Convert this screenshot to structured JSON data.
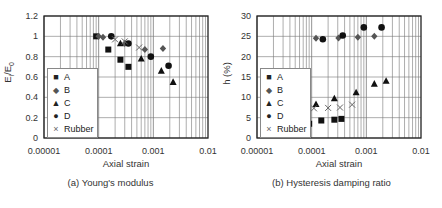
{
  "chart_data": [
    {
      "type": "scatter",
      "title": "",
      "caption": "(a) Young's modulus",
      "xlabel": "Axial strain",
      "ylabel": "Ei/E0",
      "xscale": "log",
      "xlim": [
        1e-05,
        0.01
      ],
      "ylim": [
        0,
        1.2
      ],
      "xticks": [
        "0.00001",
        "0.0001",
        "0.001",
        "0.01"
      ],
      "yticks": [
        "0",
        "0.2",
        "0.4",
        "0.6",
        "0.8",
        "1",
        "1.2"
      ],
      "grid": true,
      "legend_position": "lower left",
      "series": [
        {
          "name": "A",
          "marker": "square",
          "x": [
            9e-05,
            0.00015,
            0.00025,
            0.00035
          ],
          "y": [
            1.0,
            0.87,
            0.77,
            0.7
          ]
        },
        {
          "name": "B",
          "marker": "diamond",
          "x": [
            0.0001,
            0.00012,
            0.0003,
            0.0007,
            0.0015
          ],
          "y": [
            1.0,
            0.99,
            0.93,
            0.87,
            0.88
          ]
        },
        {
          "name": "C",
          "marker": "triangle",
          "x": [
            0.00025,
            0.0006,
            0.0014,
            0.0023
          ],
          "y": [
            0.93,
            0.78,
            0.66,
            0.55
          ]
        },
        {
          "name": "D",
          "marker": "circle",
          "x": [
            0.00017,
            0.00035,
            0.0009,
            0.0019
          ],
          "y": [
            1.0,
            0.93,
            0.8,
            0.71
          ]
        },
        {
          "name": "Rubber",
          "marker": "x",
          "x": [
            0.0002,
            0.0003,
            0.00055
          ],
          "y": [
            0.97,
            0.95,
            0.89
          ]
        }
      ]
    },
    {
      "type": "scatter",
      "title": "",
      "caption": "(b) Hysteresis damping ratio",
      "xlabel": "Axial strain",
      "ylabel": "h (%)",
      "xscale": "log",
      "xlim": [
        1e-05,
        0.01
      ],
      "ylim": [
        0,
        30
      ],
      "xticks": [
        "0.00001",
        "0.0001",
        "0.001",
        "0.01"
      ],
      "yticks": [
        "0",
        "5",
        "10",
        "15",
        "20",
        "25",
        "30"
      ],
      "grid": true,
      "legend_position": "lower left",
      "series": [
        {
          "name": "A",
          "marker": "square",
          "x": [
            9e-05,
            0.00015,
            0.00026,
            0.00035
          ],
          "y": [
            3.5,
            4.3,
            4.5,
            4.7
          ]
        },
        {
          "name": "B",
          "marker": "diamond",
          "x": [
            0.00012,
            0.00031,
            0.0007,
            0.0014
          ],
          "y": [
            24.5,
            24.6,
            24.8,
            25.0
          ]
        },
        {
          "name": "C",
          "marker": "triangle",
          "x": [
            0.00012,
            0.00026,
            0.00065,
            0.0014,
            0.0023
          ],
          "y": [
            8.3,
            9.7,
            11.2,
            13.3,
            14.0
          ]
        },
        {
          "name": "D",
          "marker": "circle",
          "x": [
            0.00016,
            0.00037,
            0.0009,
            0.0019
          ],
          "y": [
            24.3,
            25.2,
            27.2,
            27.2
          ]
        },
        {
          "name": "Rubber",
          "marker": "x",
          "x": [
            0.00011,
            0.0002,
            0.00033,
            0.00055
          ],
          "y": [
            7.3,
            7.4,
            7.5,
            8.2
          ]
        }
      ]
    }
  ],
  "legend": {
    "symbols": {
      "square": "■",
      "diamond": "◆",
      "triangle": "▲",
      "circle": "●",
      "x": "×"
    }
  }
}
